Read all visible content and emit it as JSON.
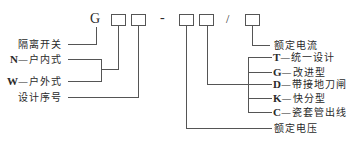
{
  "model_code": {
    "prefix": "G",
    "separator_dash": "-",
    "separator_slash": "/",
    "slots": [
      "box1",
      "box2",
      "box3",
      "box4",
      "box5"
    ]
  },
  "left_labels": [
    {
      "code": "",
      "text": "隔离开关",
      "connects_to": "G"
    },
    {
      "code": "N",
      "text": "—户内式",
      "connects_to": "box1"
    },
    {
      "code": "W",
      "text": "—户外式",
      "connects_to": "box1"
    },
    {
      "code": "",
      "text": "设计序号",
      "connects_to": "box2"
    }
  ],
  "right_labels": [
    {
      "code": "",
      "text": "额定电流",
      "connects_to": "box5"
    },
    {
      "code": "T",
      "text": "—统一设计",
      "connects_to": "box4"
    },
    {
      "code": "G",
      "text": "—改进型",
      "connects_to": "box4"
    },
    {
      "code": "D",
      "text": "—带接地刀闸",
      "connects_to": "box4"
    },
    {
      "code": "K",
      "text": "—快分型",
      "connects_to": "box4"
    },
    {
      "code": "C",
      "text": "—瓷套管出线",
      "connects_to": "box4"
    },
    {
      "code": "",
      "text": "额定电压",
      "connects_to": "box3"
    }
  ],
  "colors": {
    "line": "#555555",
    "text": "#2a2a2a",
    "background": "#ffffff"
  }
}
